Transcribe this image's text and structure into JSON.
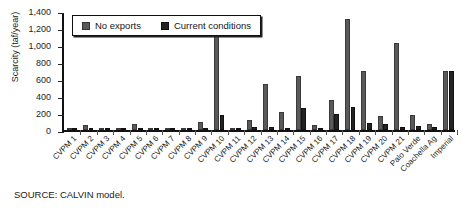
{
  "chart_data": {
    "type": "bar",
    "title": "",
    "xlabel": "",
    "ylabel": "Scarcity (taf/year)",
    "ylim": [
      0,
      1400
    ],
    "yticks": [
      0,
      200,
      400,
      600,
      800,
      1000,
      1200,
      1400
    ],
    "ytick_labels": [
      "0",
      "200",
      "400",
      "600",
      "800",
      "1,000",
      "1,200",
      "1,400"
    ],
    "grid": false,
    "legend_position": "top-left-inside",
    "categories": [
      "CVPM 1",
      "CVPM 2",
      "CVPM 3",
      "CVPM 4",
      "CVPM 5",
      "CVPM 6",
      "CVPM 7",
      "CVPM 8",
      "CVPM 9",
      "CVPM 10",
      "CVPM 11",
      "CVPM 12",
      "CVPM 13",
      "CVPM 14",
      "CVPM 15",
      "CVPM 16",
      "CVPM 17",
      "CVPM 18",
      "CVPM 19",
      "CVPM 20",
      "CVPM 21",
      "Palo Verde",
      "Coachella Ag",
      "Imperial"
    ],
    "series": [
      {
        "name": "No exports",
        "color": "#5a5a5a",
        "values": [
          18,
          55,
          8,
          20,
          70,
          12,
          10,
          15,
          95,
          1130,
          25,
          120,
          540,
          210,
          640,
          55,
          350,
          1310,
          690,
          160,
          1020,
          175,
          70,
          700
        ]
      },
      {
        "name": "Current conditions",
        "color": "#232323",
        "values": [
          6,
          10,
          4,
          8,
          12,
          5,
          5,
          6,
          20,
          175,
          10,
          30,
          40,
          25,
          260,
          12,
          185,
          265,
          80,
          75,
          35,
          45,
          30,
          690
        ]
      }
    ]
  },
  "legend": {
    "items": [
      {
        "label": "No exports",
        "swatch": "light-gray"
      },
      {
        "label": "Current conditions",
        "swatch": "dark-gray"
      }
    ]
  },
  "source_note": "SOURCE: CALVIN model."
}
